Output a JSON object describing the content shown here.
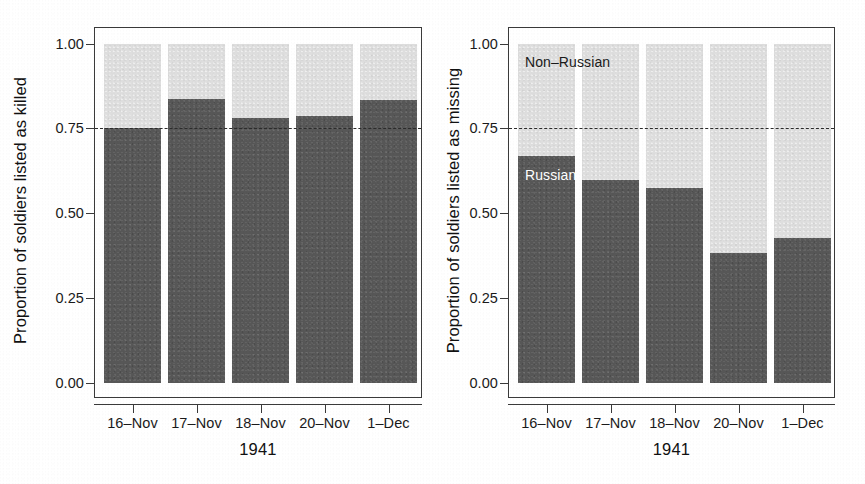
{
  "chart_data": {
    "type": "bar",
    "layout": "two stacked-bar panels side by side, 100% stacked",
    "categories": [
      "16–Nov",
      "17–Nov",
      "18–Nov",
      "20–Nov",
      "1–Dec"
    ],
    "ylim": [
      0.0,
      1.0
    ],
    "ytick_labels": [
      "0.00",
      "0.25",
      "0.50",
      "0.75",
      "1.00"
    ],
    "ytick_values": [
      0.0,
      0.25,
      0.5,
      0.75,
      1.0
    ],
    "grid": false,
    "legend_position": "inline annotations inside right panel",
    "reference_line": {
      "value": 0.75,
      "style": "dashed",
      "color": "#2b2b2b"
    },
    "colors": {
      "russian": "#575757",
      "non_russian": "#dedede"
    },
    "panels": [
      {
        "id": "killed",
        "ylabel": "Proportion of soldiers listed as killed",
        "xlabel": "1941",
        "series": [
          {
            "name": "Russian",
            "values": [
              0.752,
              0.838,
              0.782,
              0.788,
              0.835
            ]
          },
          {
            "name": "Non–Russian",
            "values": [
              0.248,
              0.162,
              0.218,
              0.212,
              0.165
            ]
          }
        ],
        "annotations": []
      },
      {
        "id": "missing",
        "ylabel": "Proportion of soldiers listed as missing",
        "xlabel": "1941",
        "series": [
          {
            "name": "Russian",
            "values": [
              0.669,
              0.599,
              0.575,
              0.383,
              0.428
            ]
          },
          {
            "name": "Non–Russian",
            "values": [
              0.331,
              0.401,
              0.425,
              0.617,
              0.572
            ]
          }
        ],
        "annotations": [
          {
            "label": "Non–Russian",
            "x": 0.1,
            "y": 0.93
          },
          {
            "label": "Russian",
            "x": 0.1,
            "y": 0.6
          }
        ]
      }
    ]
  },
  "panel_left": {
    "ylabel": "Proportion of soldiers listed as killed",
    "xlabel": "1941",
    "ytick_labels": [
      "1.00",
      "0.75",
      "0.50",
      "0.25",
      "0.00"
    ],
    "xtick_labels": [
      "16–Nov",
      "17–Nov",
      "18–Nov",
      "20–Nov",
      "1–Dec"
    ]
  },
  "panel_right": {
    "ylabel": "Proportion of soldiers listed as missing",
    "xlabel": "1941",
    "ytick_labels": [
      "1.00",
      "0.75",
      "0.50",
      "0.25",
      "0.00"
    ],
    "xtick_labels": [
      "16–Nov",
      "17–Nov",
      "18–Nov",
      "20–Nov",
      "1–Dec"
    ],
    "annot_non_russian": "Non–Russian",
    "annot_russian": "Russian"
  }
}
